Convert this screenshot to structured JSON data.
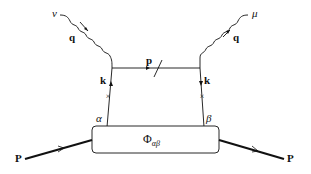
{
  "diagram": {
    "labels": {
      "nu": "ν",
      "mu": "μ",
      "q_left": "q",
      "q_right": "q",
      "p_line": "p",
      "k_left": "k",
      "k_right": "k",
      "alpha": "α",
      "beta": "β",
      "phi": "Φ",
      "phi_sub": "αβ",
      "P_in": "P",
      "P_out": "P"
    },
    "colors": {
      "stroke": "#111111",
      "background": "#ffffff"
    }
  }
}
